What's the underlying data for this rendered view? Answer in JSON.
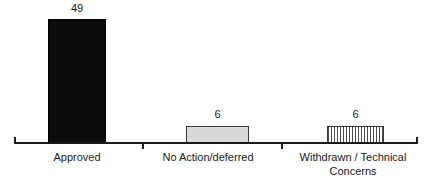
{
  "chart_data": {
    "type": "bar",
    "title": "",
    "subtitle": "",
    "xlabel": "",
    "ylabel": "",
    "categories": [
      "Approved",
      "No Action/deferred",
      "Withdrawn / Technical Concerns"
    ],
    "values": [
      49,
      6,
      6
    ],
    "value_labels": [
      "49",
      "6",
      "6"
    ],
    "ylim": [
      0,
      49
    ],
    "grid": false,
    "legend": "none",
    "axis": {
      "x_axis_visible": true,
      "y_axis_visible": false,
      "tick_count": 2
    },
    "series_styles": [
      {
        "name": "Approved",
        "fill": "solid-black",
        "color": "#0d0d0d"
      },
      {
        "name": "No Action/deferred",
        "fill": "solid-light-gray",
        "color": "#d8d8d8"
      },
      {
        "name": "Withdrawn / Technical Concerns",
        "fill": "vertical-hatch",
        "color": "#4a4a4a"
      }
    ]
  },
  "labels": {
    "value_approved": "49",
    "value_noaction": "6",
    "value_withdrawn": "6",
    "cat_approved": "Approved",
    "cat_noaction": "No Action/deferred",
    "cat_withdrawn_line1": "Withdrawn / Technical",
    "cat_withdrawn_line2": "Concerns"
  }
}
